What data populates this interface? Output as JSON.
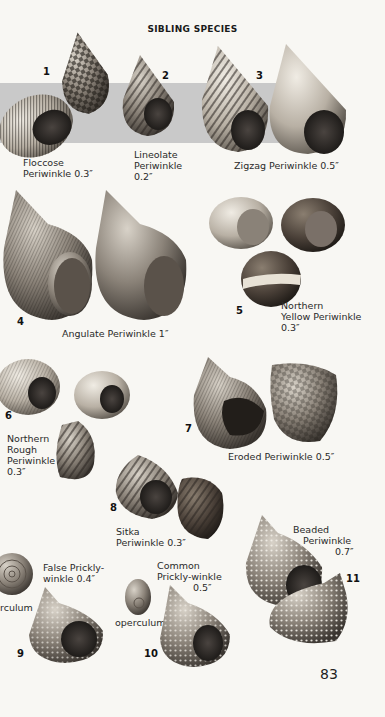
{
  "page": {
    "title": "SIBLING SPECIES",
    "page_number": "83",
    "band_color": "#c9c9c9",
    "background_color": "#f8f7f3"
  },
  "species": [
    {
      "num": "1",
      "lines": [
        "Floccose",
        "Periwinkle 0.3″"
      ]
    },
    {
      "num": "2",
      "lines": [
        "Lineolate",
        "Periwinkle",
        "0.2″"
      ]
    },
    {
      "num": "3",
      "lines": [
        "Zigzag Periwinkle 0.5″"
      ]
    },
    {
      "num": "4",
      "lines": [
        "Angulate Periwinkle 1″"
      ]
    },
    {
      "num": "5",
      "lines": [
        "Northern",
        "Yellow Periwinkle",
        "0.3″"
      ]
    },
    {
      "num": "6",
      "lines": [
        "Northern",
        "Rough",
        "Periwinkle",
        "0.3″"
      ]
    },
    {
      "num": "7",
      "lines": [
        "Eroded Periwinkle 0.5″"
      ]
    },
    {
      "num": "8",
      "lines": [
        "Sitka",
        "Periwinkle 0.3″"
      ]
    },
    {
      "num": "9",
      "lines": [
        "False Prickly-",
        "winkle 0.4″"
      ],
      "extra": "rculum"
    },
    {
      "num": "10",
      "lines": [
        "Common",
        "Prickly-winkle",
        "0.5″"
      ],
      "extra": "operculum"
    },
    {
      "num": "11",
      "lines": [
        "Beaded",
        "Periwinkle",
        "0.7″"
      ]
    }
  ],
  "illustrations": [
    "floccose-periwinkle-shells",
    "lineolate-periwinkle-shell",
    "zigzag-periwinkle-shells",
    "angulate-periwinkle-shells",
    "northern-yellow-periwinkle-shells",
    "northern-rough-periwinkle-shells",
    "eroded-periwinkle-shells",
    "sitka-periwinkle-shells",
    "false-pricklywinkle-shell",
    "common-pricklywinkle-shell",
    "beaded-periwinkle-shells"
  ]
}
